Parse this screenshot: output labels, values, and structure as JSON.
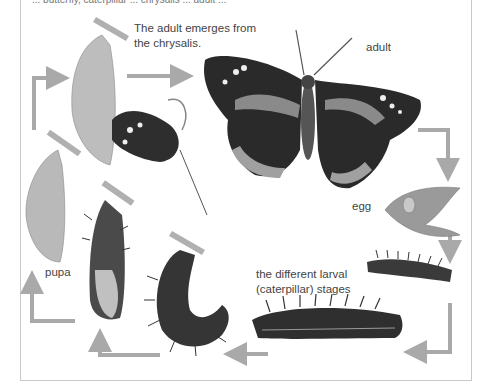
{
  "diagram": {
    "cut_off_header_text": "... butterfly, caterpillar ... chrysalis ... adult ...",
    "labels": {
      "emerge": [
        "The adult emerges from",
        "the chrysalis."
      ],
      "adult": "adult",
      "egg": "egg",
      "larval": [
        "the different larval",
        "(caterpillar) stages"
      ],
      "pupa": "pupa"
    },
    "stages": [
      "adult",
      "egg",
      "larva (small)",
      "larva (large)",
      "larva (curled)",
      "larva (hanging)",
      "pupa",
      "emerging adult"
    ],
    "colors": {
      "arrow": "#a9a9a9",
      "label_text": "#444444",
      "frame_border": "#c8c8c8",
      "wing_dark": "#2a2a2a",
      "wing_band": "#8a8a8a",
      "leaf": "#9a9a9a",
      "pupa": "#b9b9b9"
    }
  }
}
